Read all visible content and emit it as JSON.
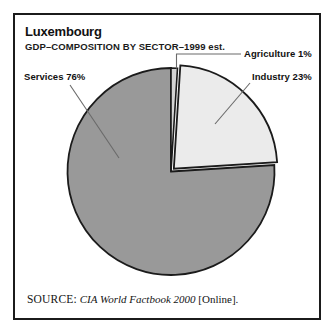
{
  "card": {
    "title": "Luxembourg",
    "subtitle": "GDP–COMPOSITION BY SECTOR–1999 est.",
    "border_color": "#1b1b1b"
  },
  "source": {
    "label": "SOURCE:",
    "title": "CIA World Factbook 2000",
    "medium": "[Online]."
  },
  "labels": {
    "agriculture": "Agriculture 1%",
    "industry": "Industry 23%",
    "services": "Services 76%"
  },
  "chart_data": {
    "type": "pie",
    "title": "Luxembourg",
    "subtitle": "GDP–COMPOSITION BY SECTOR–1999 est.",
    "xlabel": "",
    "ylabel": "",
    "legend_position": "callout-labels",
    "grid": false,
    "units": "percent",
    "total": 100,
    "start_angle_deg": 0,
    "direction": "clockwise",
    "categories": [
      "Agriculture",
      "Industry",
      "Services"
    ],
    "values": [
      1,
      23,
      76
    ],
    "slices": [
      {
        "name": "Agriculture",
        "value": 1,
        "label": "Agriculture 1%",
        "color": "#d4d4d4",
        "start_deg": 0,
        "end_deg": 3.6,
        "exploded": false
      },
      {
        "name": "Industry",
        "value": 23,
        "label": "Industry 23%",
        "color": "#ebebeb",
        "start_deg": 3.6,
        "end_deg": 86.4,
        "exploded": true
      },
      {
        "name": "Services",
        "value": 76,
        "label": "Services 76%",
        "color": "#999999",
        "start_deg": 86.4,
        "end_deg": 360,
        "exploded": false
      }
    ]
  }
}
